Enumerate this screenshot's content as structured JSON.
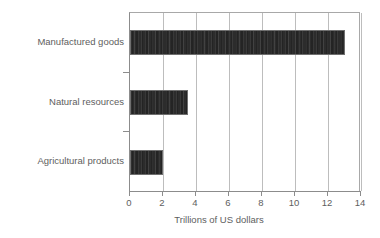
{
  "chart_data": {
    "type": "bar",
    "orientation": "horizontal",
    "title": "",
    "subtitle": "",
    "xlabel": "Trillions of US dollars",
    "ylabel": "",
    "categories": [
      "Manufactured goods",
      "Natural resources",
      "Agricultural products"
    ],
    "values": [
      13.0,
      3.5,
      2.0
    ],
    "series": [
      {
        "name": "Trillions of US dollars",
        "values": [
          13.0,
          3.5,
          2.0
        ]
      }
    ],
    "xlim": [
      0,
      14
    ],
    "xticks": [
      0,
      2,
      4,
      6,
      8,
      10,
      12,
      14
    ],
    "xticklabels": [
      "0",
      "2",
      "4",
      "6",
      "8",
      "10",
      "12",
      "14"
    ],
    "grid": "vertical",
    "legend": "none",
    "bar_color": "#2c2c2c",
    "bar_edge_color": "#6f6f6f",
    "axis_color": "#8c8c8c",
    "gridline_color": "#bdbdbd",
    "text_color": "#5e5e5e",
    "background_color": "#ffffff"
  }
}
